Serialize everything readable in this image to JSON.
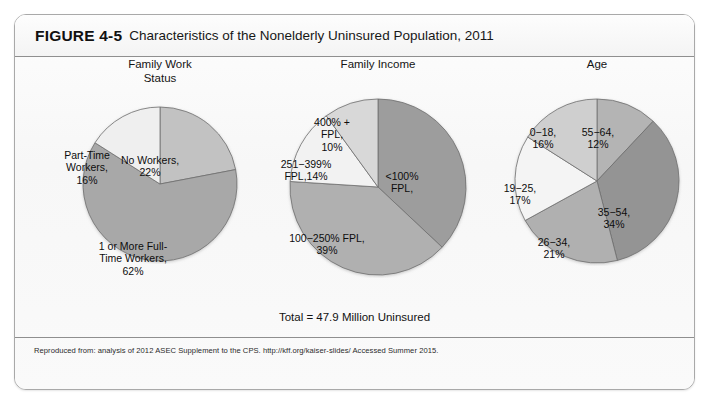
{
  "figure": {
    "label": "FIGURE 4-5",
    "title": "Characteristics of the Nonelderly Uninsured Population, 2011",
    "total_caption": "Total = 47.9 Million Uninsured",
    "source_note": "Reproduced from: analysis of 2012 ASEC Supplement to the CPS. http://kff.org/kaiser-slides/ Accessed Summer 2015."
  },
  "colors": {
    "frame_border": "#a9a9a9",
    "divider": "#8f8f8f",
    "page_background": "#ffffff",
    "figure_background": "#fbfbfb",
    "slice_outline": "#6e6e6e",
    "gray_darkest": "#8d8d8d",
    "gray_dark": "#9a9a9a",
    "gray_mid": "#a8a8a8",
    "gray_light": "#c2c2c2",
    "gray_lighter": "#d6d6d6",
    "gray_lightest": "#f0f0f0"
  },
  "chart_data": [
    {
      "type": "pie",
      "title": "Family Work\nStatus",
      "categories": [
        "No Workers",
        "1 or More Full-Time Workers",
        "Part-Time Workers"
      ],
      "values": [
        22,
        62,
        16
      ],
      "labels": [
        "No Workers,\n22%",
        "1 or More Full-\nTime Workers,\n62%",
        "Part-Time\nWorkers,\n16%"
      ],
      "slice_colors": [
        "#c2c2c2",
        "#a8a8a8",
        "#efefef"
      ],
      "start_angle": 0,
      "direction": "clockwise",
      "legend": "none",
      "grid": false
    },
    {
      "type": "pie",
      "title": "Family Income",
      "categories": [
        "<100% FPL",
        "100-250% FPL",
        "251-399% FPL",
        "400% + FPL"
      ],
      "values": [
        37,
        39,
        14,
        10
      ],
      "labels": [
        "<100%\nFPL,",
        "100−250% FPL,\n39%",
        "251−399%\nFPL,14%",
        "400% +\nFPL,\n10%"
      ],
      "slice_colors": [
        "#9d9d9d",
        "#b0b0b0",
        "#f2f2f2",
        "#d8d8d8"
      ],
      "start_angle": 0,
      "direction": "clockwise",
      "legend": "none",
      "grid": false
    },
    {
      "type": "pie",
      "title": "Age",
      "categories": [
        "55-64",
        "35-54",
        "26-34",
        "19-25",
        "0-18"
      ],
      "values": [
        12,
        34,
        21,
        17,
        16
      ],
      "labels": [
        "55−64,\n12%",
        "35−54,\n34%",
        "26−34,\n21%",
        "19−25,\n17%",
        "0−18,\n16%"
      ],
      "slice_colors": [
        "#b4b4b4",
        "#949494",
        "#b0b0b0",
        "#f4f4f4",
        "#cfcfcf"
      ],
      "start_angle": 0,
      "direction": "clockwise",
      "legend": "none",
      "grid": false
    }
  ],
  "panels": [
    {
      "name": "family-work-status",
      "label_positions": [
        {
          "left": 62,
          "top": 50,
          "width": 86
        },
        {
          "left": 30,
          "top": 136,
          "width": 116
        },
        {
          "left": 6,
          "top": 45,
          "width": 72
        }
      ]
    },
    {
      "name": "family-income",
      "label_positions": [
        {
          "left": 104,
          "top": 74,
          "width": 70
        },
        {
          "left": 6,
          "top": 136,
          "width": 116
        },
        {
          "left": 0,
          "top": 62,
          "width": 86
        },
        {
          "left": 38,
          "top": 20,
          "width": 62
        }
      ]
    },
    {
      "name": "age",
      "label_positions": [
        {
          "left": 82,
          "top": 30,
          "width": 58
        },
        {
          "left": 96,
          "top": 110,
          "width": 62
        },
        {
          "left": 36,
          "top": 140,
          "width": 62
        },
        {
          "left": 2,
          "top": 86,
          "width": 62
        },
        {
          "left": 28,
          "top": 30,
          "width": 56
        }
      ]
    }
  ]
}
